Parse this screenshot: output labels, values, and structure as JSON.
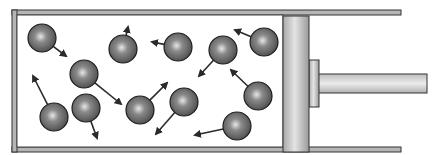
{
  "diagram": {
    "type": "gas-in-cylinder-with-piston",
    "colors": {
      "wall": "#b0b0b0",
      "wall_stroke": "#333333",
      "piston": "#c8c8c8",
      "particle": "#6e6e6e",
      "particle_highlight": "#e0e0e0",
      "arrow": "#2a2a2a"
    },
    "cylinder": {
      "x": 12,
      "y": 10,
      "right": 300,
      "bottom": 152,
      "top_wall_end": 401,
      "bottom_wall_end": 401
    },
    "piston": {
      "x": 283,
      "y": 16,
      "width": 26,
      "height": 136
    },
    "piston_block": {
      "x": 309,
      "y": 60,
      "width": 10,
      "height": 47
    },
    "rod": {
      "x": 318,
      "y": 74,
      "width": 109,
      "height": 19
    },
    "particle_radius": 14,
    "particles": [
      {
        "cx": 42,
        "cy": 38,
        "ax": 66,
        "ay": 56
      },
      {
        "cx": 123,
        "cy": 49,
        "ax": 128,
        "ay": 27
      },
      {
        "cx": 178,
        "cy": 47,
        "ax": 152,
        "ay": 42
      },
      {
        "cx": 84,
        "cy": 74,
        "ax": 121,
        "ay": 104
      },
      {
        "cx": 54,
        "cy": 117,
        "ax": 33,
        "ay": 76
      },
      {
        "cx": 86,
        "cy": 108,
        "ax": 97,
        "ay": 138
      },
      {
        "cx": 140,
        "cy": 110,
        "ax": 167,
        "ay": 83
      },
      {
        "cx": 184,
        "cy": 102,
        "ax": 156,
        "ay": 134
      },
      {
        "cx": 223,
        "cy": 50,
        "ax": 199,
        "ay": 76
      },
      {
        "cx": 264,
        "cy": 42,
        "ax": 235,
        "ay": 30
      },
      {
        "cx": 258,
        "cy": 96,
        "ax": 231,
        "ay": 70
      },
      {
        "cx": 237,
        "cy": 126,
        "ax": 195,
        "ay": 135
      }
    ]
  }
}
